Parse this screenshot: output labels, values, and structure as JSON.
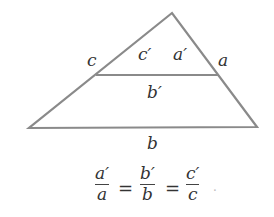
{
  "diagram": {
    "type": "similar-triangles",
    "labels": {
      "c": "c",
      "c_prime": "c′",
      "a_prime": "a′",
      "a": "a",
      "b_prime": "b′",
      "b": "b"
    },
    "equation": {
      "f1_num": "a′",
      "f1_den": "a",
      "eq1": "=",
      "f2_num": "b′",
      "f2_den": "b",
      "eq2": "=",
      "f3_num": "c′",
      "f3_den": "c",
      "period": "."
    },
    "colors": {
      "stroke": "#8a8a8a",
      "text": "#333333"
    }
  }
}
